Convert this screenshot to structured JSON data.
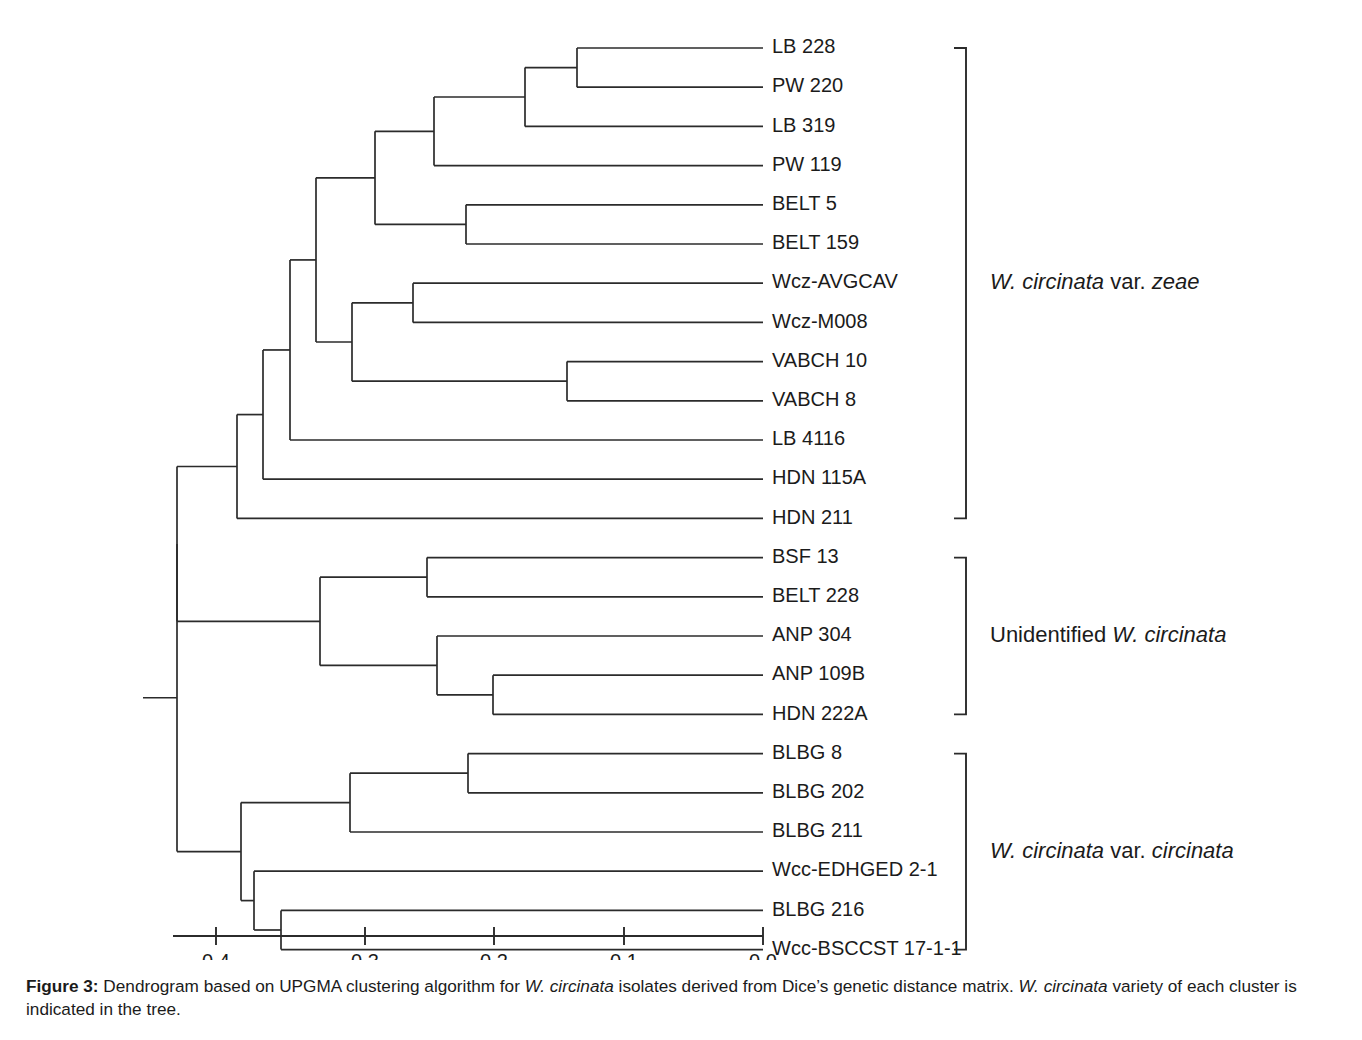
{
  "figure": {
    "caption_number": "Figure 3:",
    "caption_part1": " Dendrogram based on UPGMA clustering algorithm for ",
    "caption_italic1": "W. circinata",
    "caption_part2": " isolates derived from Dice’s genetic distance matrix. ",
    "caption_italic2": "W. circinata",
    "caption_part3": " variety of each cluster is indicated in the tree."
  },
  "chart_data": {
    "type": "dendrogram",
    "title": "Dendrogram based on UPGMA clustering algorithm for W. circinata isolates",
    "xlabel": "",
    "ylabel": "",
    "axis": {
      "orientation": "horizontal-reversed",
      "ticks": [
        "0.4",
        "0.3",
        "0.2",
        "0.1",
        "0.0"
      ],
      "tick_values": [
        0.4,
        0.3,
        0.2,
        0.1,
        0.0
      ],
      "tick_pixels": [
        216,
        365,
        494,
        624,
        763
      ],
      "axis_start_px": 173,
      "axis_end_px": 763,
      "axis_y_px": 936,
      "distance_metric": "Dice's genetic distance",
      "grid": false
    },
    "layout": {
      "first_row_y_px": 48,
      "row_spacing_px": 39.2,
      "leaf_x_px": 763,
      "label_x_px": 772,
      "root_x_px": 177,
      "root_stub_x_px": 143,
      "bracket_x_px": 966,
      "bracket_tick_px": 12,
      "cluster_label_x_px": 990
    },
    "leaves": [
      {
        "label": "LB 228"
      },
      {
        "label": "PW 220"
      },
      {
        "label": "LB 319"
      },
      {
        "label": "PW  119"
      },
      {
        "label": "BELT 5"
      },
      {
        "label": "BELT 159"
      },
      {
        "label": "Wcz-AVGCAV"
      },
      {
        "label": "Wcz-M008"
      },
      {
        "label": "VABCH 10"
      },
      {
        "label": "VABCH 8"
      },
      {
        "label": "LB 4116"
      },
      {
        "label": "HDN 115A"
      },
      {
        "label": "HDN 211"
      },
      {
        "label": "BSF 13"
      },
      {
        "label": "BELT 228"
      },
      {
        "label": "ANP 304"
      },
      {
        "label": "ANP 109B"
      },
      {
        "label": "HDN 222A"
      },
      {
        "label": "BLBG 8"
      },
      {
        "label": "BLBG 202"
      },
      {
        "label": "BLBG 211"
      },
      {
        "label": "Wcc-EDHGED 2-1"
      },
      {
        "label": "BLBG 216"
      },
      {
        "label": "Wcc-BSCCST 17-1-1"
      }
    ],
    "nodes": [
      {
        "id": "n1",
        "x_px": 577,
        "children": [
          {
            "leaf": 0
          },
          {
            "leaf": 1
          }
        ]
      },
      {
        "id": "n2",
        "x_px": 525,
        "children": [
          {
            "node": "n1"
          },
          {
            "leaf": 2
          }
        ]
      },
      {
        "id": "n3",
        "x_px": 434,
        "children": [
          {
            "node": "n2"
          },
          {
            "leaf": 3
          }
        ]
      },
      {
        "id": "n4",
        "x_px": 466,
        "children": [
          {
            "leaf": 4
          },
          {
            "leaf": 5
          }
        ]
      },
      {
        "id": "n5",
        "x_px": 375,
        "children": [
          {
            "node": "n3"
          },
          {
            "node": "n4"
          }
        ]
      },
      {
        "id": "n6",
        "x_px": 413,
        "children": [
          {
            "leaf": 6
          },
          {
            "leaf": 7
          }
        ]
      },
      {
        "id": "n7",
        "x_px": 567,
        "children": [
          {
            "leaf": 8
          },
          {
            "leaf": 9
          }
        ]
      },
      {
        "id": "n8",
        "x_px": 352,
        "children": [
          {
            "node": "n6"
          },
          {
            "node": "n7"
          }
        ]
      },
      {
        "id": "n9",
        "x_px": 316,
        "children": [
          {
            "node": "n5"
          },
          {
            "node": "n8"
          }
        ]
      },
      {
        "id": "n10",
        "x_px": 290,
        "children": [
          {
            "node": "n9"
          },
          {
            "leaf": 10
          }
        ]
      },
      {
        "id": "n11",
        "x_px": 263,
        "children": [
          {
            "node": "n10"
          },
          {
            "leaf": 11
          }
        ]
      },
      {
        "id": "n12",
        "x_px": 237,
        "children": [
          {
            "node": "n11"
          },
          {
            "leaf": 12
          }
        ]
      },
      {
        "id": "n13",
        "x_px": 427,
        "children": [
          {
            "leaf": 13
          },
          {
            "leaf": 14
          }
        ]
      },
      {
        "id": "n14",
        "x_px": 493,
        "children": [
          {
            "leaf": 16
          },
          {
            "leaf": 17
          }
        ]
      },
      {
        "id": "n15",
        "x_px": 437,
        "children": [
          {
            "leaf": 15
          },
          {
            "node": "n14"
          }
        ]
      },
      {
        "id": "n16",
        "x_px": 320,
        "children": [
          {
            "node": "n13"
          },
          {
            "node": "n15"
          }
        ]
      },
      {
        "id": "n17",
        "x_px": 177,
        "children": [
          {
            "node": "n12"
          },
          {
            "node": "n16"
          }
        ]
      },
      {
        "id": "n18",
        "x_px": 468,
        "children": [
          {
            "leaf": 18
          },
          {
            "leaf": 19
          }
        ]
      },
      {
        "id": "n19",
        "x_px": 350,
        "children": [
          {
            "node": "n18"
          },
          {
            "leaf": 20
          }
        ]
      },
      {
        "id": "n20",
        "x_px": 281,
        "children": [
          {
            "leaf": 22
          },
          {
            "leaf": 23
          }
        ]
      },
      {
        "id": "n21",
        "x_px": 254,
        "children": [
          {
            "leaf": 21
          },
          {
            "node": "n20"
          }
        ]
      },
      {
        "id": "n22",
        "x_px": 241,
        "children": [
          {
            "node": "n19"
          },
          {
            "node": "n21"
          }
        ]
      },
      {
        "id": "n23",
        "x_px": 177,
        "children": [
          {
            "node": "n17"
          },
          {
            "node": "n22"
          }
        ],
        "root": true
      }
    ],
    "clusters": [
      {
        "first_leaf": 0,
        "last_leaf": 12,
        "segments": [
          {
            "text": "W. circinata",
            "italic": true
          },
          {
            "text": " var. ",
            "italic": false
          },
          {
            "text": "zeae",
            "italic": true
          }
        ],
        "plain_text": "W. circinata var. zeae"
      },
      {
        "first_leaf": 13,
        "last_leaf": 17,
        "segments": [
          {
            "text": "Unidentified ",
            "italic": false
          },
          {
            "text": "W. circinata",
            "italic": true
          }
        ],
        "plain_text": "Unidentified W. circinata"
      },
      {
        "first_leaf": 18,
        "last_leaf": 23,
        "segments": [
          {
            "text": "W. circinata",
            "italic": true
          },
          {
            "text": " var. ",
            "italic": false
          },
          {
            "text": "circinata",
            "italic": true
          }
        ],
        "plain_text": "W. circinata var. circinata"
      }
    ],
    "colors": {
      "line": "#2b2b2b",
      "text": "#1b1b1b",
      "background": "#ffffff"
    }
  }
}
